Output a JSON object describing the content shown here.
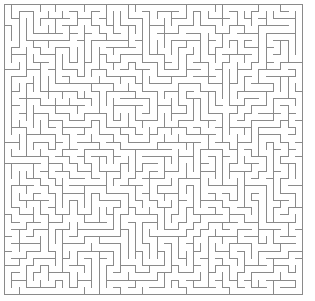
{
  "figure": {
    "type": "maze",
    "canvas": {
      "width": 315,
      "height": 301,
      "background": "#ffffff"
    }
  },
  "maze": {
    "columns": 41,
    "rows": 40,
    "cell_size": 7.27,
    "origin_x": 4.5,
    "origin_y": 4.0,
    "wall_color": "#8a8a8a",
    "wall_width": 1,
    "border": "closed",
    "topology": "perfect",
    "generator": "randomized-depth-first-search",
    "seed": 20240517,
    "entrance": {
      "label": "none",
      "visible": false
    },
    "exit": {
      "label": "none",
      "visible": false
    }
  },
  "chart_data": {
    "type": "diagram",
    "grid": {
      "columns": 41,
      "rows": 40
    },
    "xlim": [
      0,
      41
    ],
    "ylim": [
      0,
      40
    ],
    "legend": [],
    "annotations": []
  }
}
